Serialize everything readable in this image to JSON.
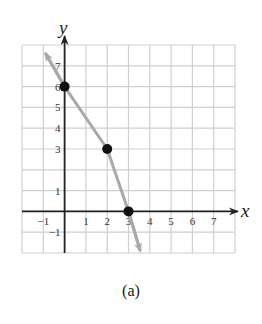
{
  "chart_data": {
    "type": "line",
    "title": "",
    "caption": "(a)",
    "xlabel": "x",
    "ylabel": "y",
    "xlim": [
      -2,
      8
    ],
    "ylim": [
      -2,
      8
    ],
    "grid": true,
    "x_ticks": [
      -1,
      1,
      2,
      3,
      4,
      5,
      6,
      7
    ],
    "y_ticks": [
      -1,
      1,
      3,
      4,
      5,
      6,
      7
    ],
    "series": [
      {
        "name": "piecewise linear",
        "color": "#a9a9a9",
        "points": [
          {
            "x": 0,
            "y": 6
          },
          {
            "x": 2,
            "y": 3
          },
          {
            "x": 3,
            "y": 0
          }
        ],
        "arrow_start": {
          "x": -0.9,
          "y": 7.6
        },
        "arrow_end": {
          "x": 3.55,
          "y": -1.9
        }
      }
    ],
    "marked_points": [
      {
        "x": 0,
        "y": 6
      },
      {
        "x": 2,
        "y": 3
      },
      {
        "x": 3,
        "y": 0
      }
    ],
    "colors": {
      "grid": "#cfcfcf",
      "axis": "#222222",
      "line": "#a9a9a9",
      "point": "#111111"
    }
  }
}
